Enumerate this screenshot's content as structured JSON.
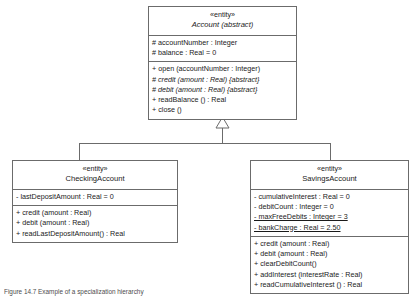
{
  "diagram": {
    "type": "uml-class-diagram",
    "relationship": "generalization",
    "classes": [
      {
        "id": "account",
        "stereotype": "«entity»",
        "name": "Account (abstract)",
        "is_abstract": true,
        "attributes": [
          {
            "text": "# accountNumber : Integer",
            "italic": false,
            "static": false
          },
          {
            "text": "# balance : Real = 0",
            "italic": false,
            "static": false
          }
        ],
        "operations": [
          {
            "text": "+ open (accountNumber : Integer)",
            "italic": false,
            "static": false
          },
          {
            "text": "# credit (amount : Real) {abstract}",
            "italic": true,
            "static": false
          },
          {
            "text": "# debit (amount : Real) {abstract}",
            "italic": true,
            "static": false
          },
          {
            "text": "+ readBalance () : Real",
            "italic": false,
            "static": false
          },
          {
            "text": "+ close ()",
            "italic": false,
            "static": false
          }
        ]
      },
      {
        "id": "checking",
        "stereotype": "«entity»",
        "name": "CheckingAccount",
        "is_abstract": false,
        "attributes": [
          {
            "text": "- lastDepositAmount : Real = 0",
            "italic": false,
            "static": false
          }
        ],
        "operations": [
          {
            "text": "+ credit (amount : Real)",
            "italic": false,
            "static": false
          },
          {
            "text": "+ debit (amount : Real)",
            "italic": false,
            "static": false
          },
          {
            "text": "+ readLastDepositAmount() : Real",
            "italic": false,
            "static": false
          }
        ]
      },
      {
        "id": "savings",
        "stereotype": "«entity»",
        "name": "SavingsAccount",
        "is_abstract": false,
        "attributes": [
          {
            "text": "- cumulativeInterest : Real = 0",
            "italic": false,
            "static": false
          },
          {
            "text": "- debitCount : Integer = 0",
            "italic": false,
            "static": false
          },
          {
            "text": "- maxFreeDebits : Integer = 3",
            "italic": false,
            "static": true
          },
          {
            "text": "- bankCharge : Real = 2.50",
            "italic": false,
            "static": true
          }
        ],
        "operations": [
          {
            "text": "+ credit (amount : Real)",
            "italic": false,
            "static": false
          },
          {
            "text": "+ debit (amount : Real)",
            "italic": false,
            "static": false
          },
          {
            "text": "+ clearDebitCount()",
            "italic": false,
            "static": false
          },
          {
            "text": "+ addInterest (interestRate : Real)",
            "italic": false,
            "static": false
          },
          {
            "text": "+ readCumulativeInterest () : Real",
            "italic": false,
            "static": false
          }
        ]
      }
    ]
  },
  "caption": {
    "text": "Figure 14.7  Example of a specialization hierarchy"
  },
  "colors": {
    "border": "#6b6b6b",
    "background": "#ffffff",
    "text": "#1a1a1a",
    "caption": "#4d4d4d"
  }
}
